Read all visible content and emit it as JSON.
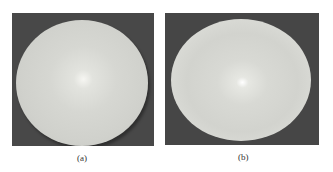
{
  "figure": {
    "panels": [
      {
        "id": "a",
        "caption": "(a)",
        "description": "Photograph of a pale circular disc on a dark gray background, soft highlight near center"
      },
      {
        "id": "b",
        "caption": "(b)",
        "description": "Photograph of a slightly oval pale disc on a dark gray background, bright point highlight at center"
      }
    ],
    "colors": {
      "background_panel": "#484848",
      "disc": "#d4d5d0",
      "page": "#ffffff"
    }
  }
}
